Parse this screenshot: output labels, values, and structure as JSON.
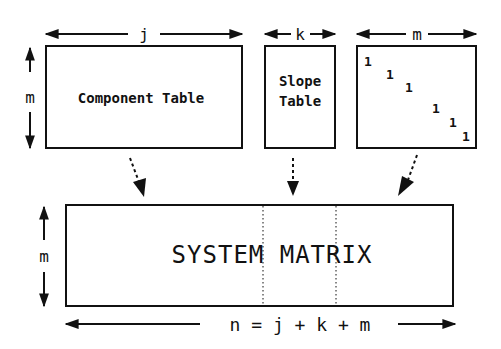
{
  "diagram": {
    "top_row": {
      "component_table": {
        "label": "Component Table",
        "width_label": "j",
        "height_label": "m"
      },
      "slope_table": {
        "label_line1": "Slope",
        "label_line2": "Table",
        "width_label": "k"
      },
      "identity_block": {
        "width_label": "m",
        "diagonal_values": [
          "1",
          "1",
          "1",
          "1",
          "1",
          "1"
        ]
      }
    },
    "system_matrix": {
      "label": "SYSTEM MATRIX",
      "height_label": "m",
      "width_label": "n = j + k + m"
    },
    "colors": {
      "line": "#111111",
      "background": "#ffffff"
    }
  }
}
